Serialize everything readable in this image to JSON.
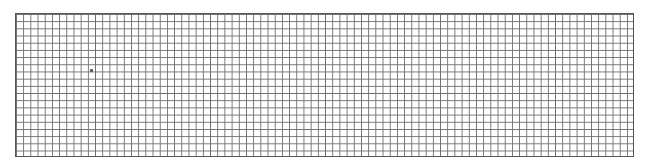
{
  "grid": {
    "columns": 86,
    "rows": 20,
    "line_color": "#6e6e6e",
    "border_color": "#555555",
    "background": "#ffffff"
  },
  "marks": [
    {
      "type": "dot",
      "x": 90,
      "y": 69
    }
  ]
}
